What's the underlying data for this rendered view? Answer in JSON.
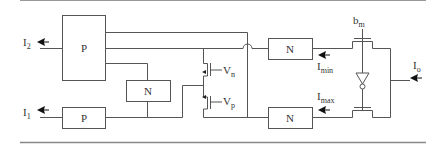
{
  "blocks": {
    "p_top": "P",
    "p_bottom": "P",
    "n_middle": "N",
    "n_top": "N",
    "n_bottom": "N"
  },
  "signals": {
    "i2": {
      "base": "I",
      "sub": "2"
    },
    "i1": {
      "base": "I",
      "sub": "1"
    },
    "vn": {
      "base": "V",
      "sub": "n"
    },
    "vp": {
      "base": "V",
      "sub": "p"
    },
    "imin": {
      "base": "I",
      "sub": "min"
    },
    "imax": {
      "base": "I",
      "sub": "max"
    },
    "bm": {
      "base": "b",
      "sub": "m"
    },
    "io": {
      "base": "I",
      "sub": "o"
    }
  },
  "colors": {
    "line": "#555555",
    "rule": "#888888"
  }
}
